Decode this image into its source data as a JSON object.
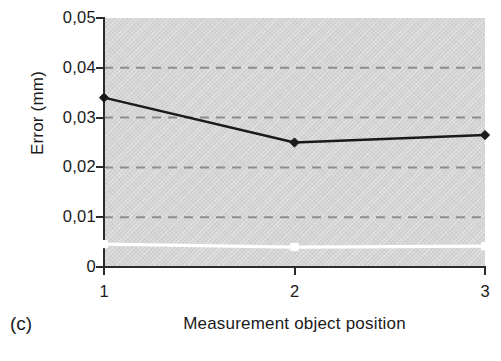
{
  "panel": {
    "label": "(c)"
  },
  "chart_data": {
    "type": "line",
    "title": "",
    "xlabel": "Measurement object position",
    "ylabel": "Error (mm)",
    "x": [
      1,
      2,
      3
    ],
    "xtick_labels": [
      "1",
      "2",
      "3"
    ],
    "xlim": [
      1,
      3
    ],
    "ytick_labels": [
      "0,05",
      "0,04",
      "0,03",
      "0,02",
      "0,01",
      "0"
    ],
    "ytick_values": [
      0.05,
      0.04,
      0.03,
      0.02,
      0.01,
      0
    ],
    "ylim": [
      0,
      0.05
    ],
    "grid": "horizontal-dashed",
    "gridline_values": [
      0.04,
      0.03,
      0.02,
      0.01
    ],
    "legend": "none",
    "plot_background_color": "#d4d4d4",
    "series": [
      {
        "name": "series-black",
        "color": "#1a1a1a",
        "marker": "diamond",
        "values": [
          0.034,
          0.025,
          0.0265
        ]
      },
      {
        "name": "series-white",
        "color": "#ffffff",
        "marker": "square",
        "values": [
          0.0046,
          0.004,
          0.0042
        ]
      }
    ]
  }
}
